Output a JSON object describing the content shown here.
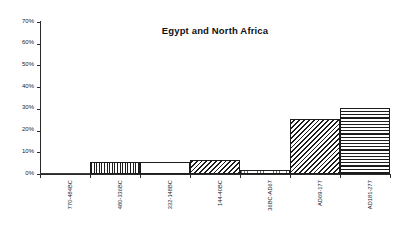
{
  "chart_data": {
    "type": "bar",
    "title": "Egypt and North Africa",
    "xlabel": "",
    "ylabel": "",
    "ylim": [
      0,
      70
    ],
    "ytick_labels": [
      "0%",
      "10%",
      "20%",
      "30%",
      "40%",
      "50%",
      "60%",
      "70%"
    ],
    "ytick_values": [
      0,
      10,
      20,
      30,
      40,
      50,
      60,
      70
    ],
    "grid": false,
    "legend": "none",
    "value_suffix": "%",
    "categories": [
      "770-484BC",
      "480-336BC",
      "332-148BC",
      "144-40BC",
      "36BC-AD67",
      "AD69-177",
      "AD181-277"
    ],
    "values": [
      0,
      5.5,
      5.5,
      6.5,
      2,
      25.5,
      30.5
    ],
    "bar_patterns": [
      "none",
      "vertical-stripes",
      "dots",
      "diagonal-hatch",
      "sparse-vertical",
      "diagonal-hatch",
      "horizontal-lines"
    ],
    "colors": {
      "axis": "#2a2a2a",
      "bar_outline": "#1c1c1c",
      "bar_fill": "#ffffff",
      "background": "#ffffff",
      "text": "#1a1a1a"
    }
  }
}
